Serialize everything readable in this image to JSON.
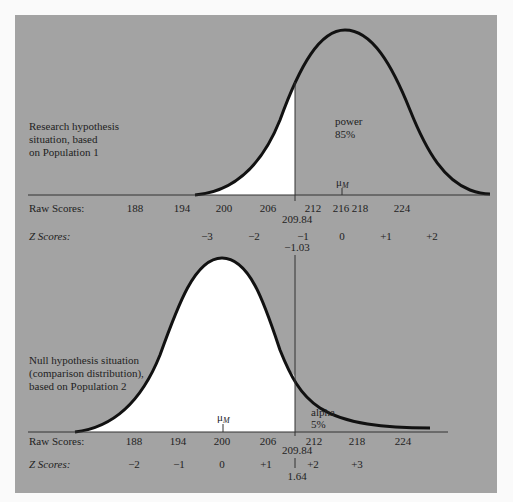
{
  "colors": {
    "panel": "#a3a3a3",
    "page": "#fafafa",
    "curve": "#111111",
    "fill": "#ffffff",
    "text": "#222222"
  },
  "top": {
    "label_lines": [
      "Research hypothesis",
      "situation, based",
      "on Population 1"
    ],
    "region_label_lines": [
      "power",
      "85%"
    ],
    "mean_label": "μ",
    "mean_sub": "M",
    "raw_label": "Raw Scores:",
    "z_label": "Z Scores:",
    "raw_ticks": [
      "188",
      "194",
      "200",
      "206",
      "212",
      "216",
      "218",
      "224"
    ],
    "z_ticks": [
      "−3",
      "−2",
      "−1",
      "0",
      "+1",
      "+2"
    ],
    "cutoff_raw": "209.84",
    "cutoff_z": "−1.03"
  },
  "bottom": {
    "label_lines": [
      "Null hypothesis situation",
      "(comparison distribution),",
      "based on Population 2"
    ],
    "region_label_lines": [
      "alpha",
      "5%"
    ],
    "mean_label": "μ",
    "mean_sub": "M",
    "raw_label": "Raw Scores:",
    "z_label": "Z Scores:",
    "raw_ticks": [
      "188",
      "194",
      "200",
      "206",
      "212",
      "218",
      "224"
    ],
    "z_ticks": [
      "−2",
      "−1",
      "0",
      "+1",
      "+2",
      "+3"
    ],
    "cutoff_raw": "209.84",
    "cutoff_z": "1.64"
  }
}
